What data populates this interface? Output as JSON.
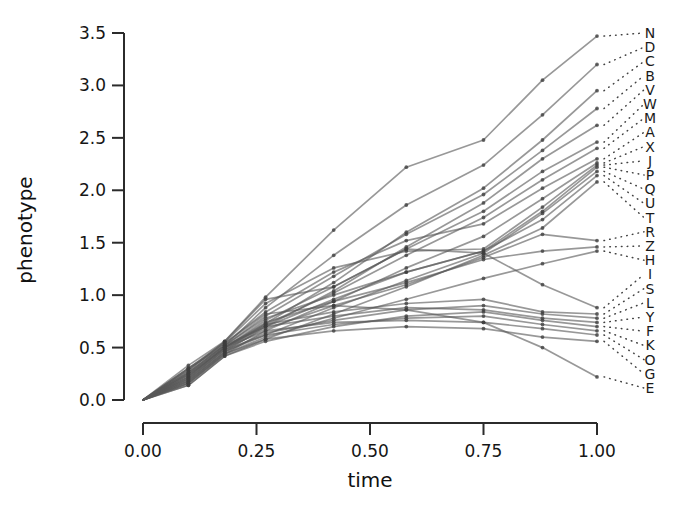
{
  "chart_data": {
    "type": "line",
    "title": "",
    "xlabel": "time",
    "ylabel": "phenotype",
    "xlim": [
      0.0,
      1.0
    ],
    "ylim": [
      0.0,
      3.5
    ],
    "xticks": [
      0.0,
      0.25,
      0.5,
      0.75,
      1.0
    ],
    "xticklabels": [
      "0.00",
      "0.25",
      "0.50",
      "0.75",
      "1.00"
    ],
    "yticks": [
      0.0,
      0.5,
      1.0,
      1.5,
      2.0,
      2.5,
      3.0,
      3.5
    ],
    "yticklabels": [
      "0.0",
      "0.5",
      "1.0",
      "1.5",
      "2.0",
      "2.5",
      "3.0",
      "3.5"
    ],
    "grid": false,
    "legend_position": "right-labels-with-dotted-leaders",
    "line_color": "#595959",
    "vertex_color": "#3d3d3d",
    "leader_color": "#2e2e2e",
    "series_count": 26,
    "series": [
      {
        "name": "N",
        "label_y": 3.5,
        "x": [
          0.0,
          0.1,
          0.18,
          0.27,
          0.42,
          0.58,
          0.75,
          0.88,
          1.0
        ],
        "values": [
          0.0,
          0.33,
          0.56,
          0.98,
          1.62,
          2.22,
          2.48,
          3.05,
          3.47
        ]
      },
      {
        "name": "D",
        "label_y": 3.33,
        "x": [
          0.0,
          0.1,
          0.18,
          0.27,
          0.42,
          0.58,
          0.75,
          0.88,
          1.0
        ],
        "values": [
          0.0,
          0.3,
          0.52,
          0.88,
          1.38,
          1.86,
          2.24,
          2.72,
          3.2
        ]
      },
      {
        "name": "C",
        "label_y": 3.16,
        "x": [
          0.0,
          0.1,
          0.18,
          0.27,
          0.42,
          0.58,
          0.75,
          0.88,
          1.0
        ],
        "values": [
          0.0,
          0.22,
          0.5,
          0.73,
          1.12,
          1.6,
          2.02,
          2.48,
          2.95
        ]
      },
      {
        "name": "B",
        "label_y": 2.99,
        "x": [
          0.0,
          0.1,
          0.18,
          0.27,
          0.42,
          0.58,
          0.75,
          0.88,
          1.0
        ],
        "values": [
          0.0,
          0.26,
          0.52,
          0.8,
          1.18,
          1.58,
          1.96,
          2.38,
          2.78
        ]
      },
      {
        "name": "V",
        "label_y": 2.82,
        "x": [
          0.0,
          0.1,
          0.18,
          0.27,
          0.42,
          0.58,
          0.75,
          0.88,
          1.0
        ],
        "values": [
          0.0,
          0.18,
          0.46,
          0.7,
          1.04,
          1.46,
          1.88,
          2.3,
          2.62
        ]
      },
      {
        "name": "W",
        "label_y": 2.65,
        "x": [
          0.0,
          0.1,
          0.18,
          0.27,
          0.42,
          0.58,
          0.75,
          0.88,
          1.0
        ],
        "values": [
          0.0,
          0.24,
          0.5,
          0.76,
          1.08,
          1.44,
          1.8,
          2.18,
          2.46
        ]
      },
      {
        "name": "M",
        "label_y": 2.48,
        "x": [
          0.0,
          0.1,
          0.18,
          0.27,
          0.42,
          0.58,
          0.75,
          0.88,
          1.0
        ],
        "values": [
          0.0,
          0.2,
          0.48,
          0.72,
          1.02,
          1.38,
          1.74,
          2.1,
          2.4
        ]
      },
      {
        "name": "A",
        "label_y": 2.31,
        "x": [
          0.0,
          0.1,
          0.18,
          0.27,
          0.42,
          0.58,
          0.75,
          0.88,
          1.0
        ],
        "values": [
          0.0,
          0.28,
          0.54,
          0.84,
          1.22,
          1.52,
          1.68,
          2.02,
          2.3
        ]
      },
      {
        "name": "X",
        "label_y": 2.14,
        "x": [
          0.0,
          0.1,
          0.18,
          0.27,
          0.42,
          0.58,
          0.75,
          0.88,
          1.0
        ],
        "values": [
          0.0,
          0.16,
          0.44,
          0.66,
          0.94,
          1.26,
          1.56,
          1.92,
          2.26
        ]
      },
      {
        "name": "J",
        "label_y": 1.97,
        "x": [
          0.0,
          0.1,
          0.18,
          0.27,
          0.42,
          0.58,
          0.75,
          0.88,
          1.0
        ],
        "values": [
          0.0,
          0.3,
          0.55,
          0.92,
          1.26,
          1.42,
          1.44,
          1.84,
          2.24
        ]
      },
      {
        "name": "P",
        "label_y": 1.8,
        "x": [
          0.0,
          0.1,
          0.18,
          0.27,
          0.42,
          0.58,
          0.75,
          0.88,
          1.0
        ],
        "values": [
          0.0,
          0.22,
          0.5,
          0.7,
          0.96,
          1.22,
          1.42,
          1.8,
          2.22
        ]
      },
      {
        "name": "Q",
        "label_y": 1.63,
        "x": [
          0.0,
          0.1,
          0.18,
          0.27,
          0.42,
          0.58,
          0.75,
          0.88,
          1.0
        ],
        "values": [
          0.0,
          0.18,
          0.46,
          0.62,
          0.88,
          1.14,
          1.4,
          1.78,
          2.18
        ]
      },
      {
        "name": "U",
        "label_y": 1.46,
        "x": [
          0.0,
          0.1,
          0.18,
          0.27,
          0.42,
          0.58,
          0.75,
          0.88,
          1.0
        ],
        "values": [
          0.0,
          0.26,
          0.52,
          0.78,
          1.0,
          1.22,
          1.42,
          1.72,
          2.14
        ]
      },
      {
        "name": "T",
        "label_y": 1.29,
        "x": [
          0.0,
          0.1,
          0.18,
          0.27,
          0.42,
          0.58,
          0.75,
          0.88,
          1.0
        ],
        "values": [
          0.0,
          0.14,
          0.42,
          0.58,
          0.82,
          1.08,
          1.38,
          1.64,
          2.08
        ]
      },
      {
        "name": "R",
        "label_y": 1.12,
        "x": [
          0.0,
          0.1,
          0.18,
          0.27,
          0.42,
          0.58,
          0.75,
          0.88,
          1.0
        ],
        "values": [
          0.0,
          0.2,
          0.48,
          0.68,
          0.9,
          1.1,
          1.36,
          1.58,
          1.52
        ]
      },
      {
        "name": "Z",
        "label_y": 0.95,
        "x": [
          0.0,
          0.1,
          0.18,
          0.27,
          0.42,
          0.58,
          0.75,
          0.88,
          1.0
        ],
        "values": [
          0.0,
          0.24,
          0.5,
          0.74,
          0.94,
          1.12,
          1.34,
          1.42,
          1.46
        ]
      },
      {
        "name": "H",
        "label_y": 0.78,
        "x": [
          0.0,
          0.1,
          0.18,
          0.27,
          0.42,
          0.58,
          0.75,
          0.88,
          1.0
        ],
        "values": [
          0.0,
          0.16,
          0.44,
          0.6,
          0.78,
          0.96,
          1.16,
          1.3,
          1.42
        ]
      },
      {
        "name": "I",
        "label_y": 0.61,
        "x": [
          0.0,
          0.1,
          0.18,
          0.27,
          0.42,
          0.58,
          0.75,
          0.88,
          1.0
        ],
        "values": [
          0.0,
          0.28,
          0.56,
          0.96,
          1.08,
          1.44,
          1.4,
          1.1,
          0.88
        ]
      },
      {
        "name": "S",
        "label_y": 0.44,
        "x": [
          0.0,
          0.1,
          0.18,
          0.27,
          0.42,
          0.58,
          0.75,
          0.88,
          1.0
        ],
        "values": [
          0.0,
          0.22,
          0.5,
          0.72,
          0.84,
          0.92,
          0.96,
          0.84,
          0.82
        ]
      },
      {
        "name": "L",
        "label_y": 0.27,
        "x": [
          0.0,
          0.1,
          0.18,
          0.27,
          0.42,
          0.58,
          0.75,
          0.88,
          1.0
        ],
        "values": [
          0.0,
          0.18,
          0.46,
          0.64,
          0.76,
          0.86,
          0.9,
          0.82,
          0.78
        ]
      },
      {
        "name": "Y",
        "label_y": 0.1,
        "x": [
          0.0,
          0.1,
          0.18,
          0.27,
          0.42,
          0.58,
          0.75,
          0.88,
          1.0
        ],
        "values": [
          0.0,
          0.26,
          0.52,
          0.7,
          0.8,
          0.88,
          0.86,
          0.78,
          0.74
        ]
      },
      {
        "name": "F",
        "label_y": -0.07,
        "x": [
          0.0,
          0.1,
          0.18,
          0.27,
          0.42,
          0.58,
          0.75,
          0.88,
          1.0
        ],
        "values": [
          0.0,
          0.14,
          0.42,
          0.56,
          0.7,
          0.8,
          0.84,
          0.76,
          0.7
        ]
      },
      {
        "name": "K",
        "label_y": -0.24,
        "x": [
          0.0,
          0.1,
          0.18,
          0.27,
          0.42,
          0.58,
          0.75,
          0.88,
          1.0
        ],
        "values": [
          0.0,
          0.2,
          0.48,
          0.62,
          0.72,
          0.78,
          0.8,
          0.72,
          0.66
        ]
      },
      {
        "name": "O",
        "label_y": -0.41,
        "x": [
          0.0,
          0.1,
          0.18,
          0.27,
          0.42,
          0.58,
          0.75,
          0.88,
          1.0
        ],
        "values": [
          0.0,
          0.24,
          0.5,
          0.66,
          0.74,
          0.76,
          0.74,
          0.68,
          0.62
        ]
      },
      {
        "name": "G",
        "label_y": -0.58,
        "x": [
          0.0,
          0.1,
          0.18,
          0.27,
          0.42,
          0.58,
          0.75,
          0.88,
          1.0
        ],
        "values": [
          0.0,
          0.16,
          0.44,
          0.58,
          0.66,
          0.7,
          0.68,
          0.6,
          0.56
        ]
      },
      {
        "name": "E",
        "label_y": -0.75,
        "x": [
          0.0,
          0.1,
          0.18,
          0.27,
          0.42,
          0.58,
          0.75,
          0.88,
          1.0
        ],
        "values": [
          0.0,
          0.3,
          0.54,
          0.82,
          0.9,
          0.86,
          0.74,
          0.5,
          0.22
        ]
      }
    ]
  },
  "geometry": {
    "x_px_min": 143,
    "x_px_max": 597,
    "y_px_at_0": 400,
    "y_px_at_3_5": 33,
    "label_x_px": 650,
    "label_top_px": 33,
    "label_step_px": 14.2,
    "leader_start_px": 604
  }
}
